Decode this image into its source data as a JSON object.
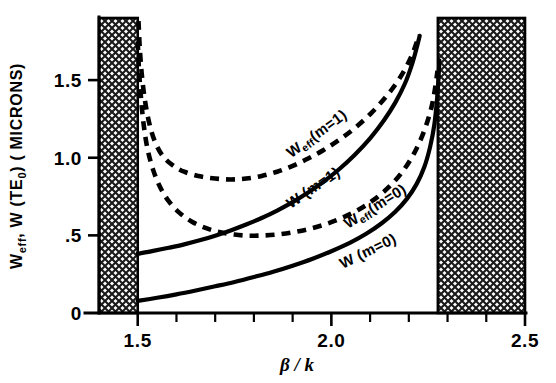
{
  "chart_data": {
    "type": "line",
    "title": "",
    "xlabel": "β / k",
    "ylabel": "Weff, W (TE0) (MICRONS)",
    "ylabel_parts": {
      "w": "W",
      "eff": "eff",
      "comma_w": ", W (TE",
      "zero": "0",
      "units": ") ( MICRONS)"
    },
    "xlim": [
      1.4,
      2.5
    ],
    "ylim": [
      0.0,
      1.9
    ],
    "xticks": [
      1.5,
      2.0,
      2.5
    ],
    "xtick_labels": [
      "1.5",
      "2.0",
      "2.5"
    ],
    "xticks_minor": [
      1.6,
      1.7,
      1.8,
      1.9,
      2.1,
      2.2,
      2.3,
      2.4
    ],
    "yticks": [
      0,
      0.5,
      1.0,
      1.5
    ],
    "ytick_labels": [
      "0",
      ".5",
      "1.0",
      "1.5"
    ],
    "grid": false,
    "legend_position": "inline-annotations",
    "shaded_regions": [
      {
        "name": "left-forbidden-band",
        "x0": 1.4,
        "x1": 1.5,
        "style": "cross-hatch"
      },
      {
        "name": "right-forbidden-band",
        "x0": 2.275,
        "x1": 2.5,
        "style": "cross-hatch"
      }
    ],
    "series": [
      {
        "name": "Weff(m=1)",
        "label": "Weff (m=1)",
        "label_base": "W",
        "label_sub": "eff",
        "label_rest": "(m=1)",
        "style": "dashed",
        "points": [
          [
            1.502,
            1.88
          ],
          [
            1.505,
            1.72
          ],
          [
            1.51,
            1.55
          ],
          [
            1.518,
            1.38
          ],
          [
            1.53,
            1.22
          ],
          [
            1.545,
            1.1
          ],
          [
            1.565,
            1.01
          ],
          [
            1.59,
            0.952
          ],
          [
            1.62,
            0.91
          ],
          [
            1.66,
            0.88
          ],
          [
            1.7,
            0.866
          ],
          [
            1.74,
            0.86
          ],
          [
            1.78,
            0.866
          ],
          [
            1.82,
            0.883
          ],
          [
            1.86,
            0.91
          ],
          [
            1.9,
            0.948
          ],
          [
            1.94,
            0.995
          ],
          [
            1.98,
            1.05
          ],
          [
            2.02,
            1.115
          ],
          [
            2.06,
            1.19
          ],
          [
            2.1,
            1.28
          ],
          [
            2.135,
            1.375
          ],
          [
            2.165,
            1.47
          ],
          [
            2.19,
            1.57
          ],
          [
            2.208,
            1.66
          ],
          [
            2.22,
            1.74
          ],
          [
            2.227,
            1.79
          ]
        ]
      },
      {
        "name": "W(m=1)",
        "label": "W (m=1)",
        "label_base": "W",
        "label_sub": "",
        "label_rest": "(m=1)",
        "style": "solid",
        "points": [
          [
            1.5,
            0.382
          ],
          [
            1.54,
            0.4
          ],
          [
            1.58,
            0.42
          ],
          [
            1.62,
            0.442
          ],
          [
            1.66,
            0.468
          ],
          [
            1.7,
            0.498
          ],
          [
            1.74,
            0.532
          ],
          [
            1.78,
            0.57
          ],
          [
            1.82,
            0.612
          ],
          [
            1.86,
            0.66
          ],
          [
            1.9,
            0.714
          ],
          [
            1.94,
            0.776
          ],
          [
            1.98,
            0.846
          ],
          [
            2.02,
            0.926
          ],
          [
            2.06,
            1.018
          ],
          [
            2.1,
            1.125
          ],
          [
            2.135,
            1.238
          ],
          [
            2.165,
            1.355
          ],
          [
            2.19,
            1.478
          ],
          [
            2.208,
            1.6
          ],
          [
            2.22,
            1.705
          ],
          [
            2.228,
            1.785
          ]
        ]
      },
      {
        "name": "Weff(m=0)",
        "label": "Weff (m=0)",
        "label_base": "W",
        "label_sub": "eff",
        "label_rest": "(m=0)",
        "style": "dashed",
        "points": [
          [
            1.5,
            1.75
          ],
          [
            1.503,
            1.58
          ],
          [
            1.508,
            1.4
          ],
          [
            1.515,
            1.22
          ],
          [
            1.525,
            1.06
          ],
          [
            1.54,
            0.92
          ],
          [
            1.558,
            0.81
          ],
          [
            1.58,
            0.72
          ],
          [
            1.608,
            0.645
          ],
          [
            1.64,
            0.588
          ],
          [
            1.675,
            0.548
          ],
          [
            1.71,
            0.522
          ],
          [
            1.75,
            0.505
          ],
          [
            1.79,
            0.498
          ],
          [
            1.83,
            0.5
          ],
          [
            1.87,
            0.508
          ],
          [
            1.91,
            0.524
          ],
          [
            1.95,
            0.546
          ],
          [
            1.99,
            0.576
          ],
          [
            2.03,
            0.615
          ],
          [
            2.07,
            0.665
          ],
          [
            2.11,
            0.73
          ],
          [
            2.15,
            0.815
          ],
          [
            2.185,
            0.915
          ],
          [
            2.215,
            1.035
          ],
          [
            2.24,
            1.175
          ],
          [
            2.258,
            1.32
          ],
          [
            2.268,
            1.45
          ],
          [
            2.274,
            1.56
          ]
        ]
      },
      {
        "name": "W(m=0)",
        "label": "W (m=0)",
        "label_base": "W",
        "label_sub": "",
        "label_rest": "(m=0)",
        "style": "solid",
        "points": [
          [
            1.5,
            0.078
          ],
          [
            1.55,
            0.098
          ],
          [
            1.6,
            0.12
          ],
          [
            1.65,
            0.145
          ],
          [
            1.7,
            0.172
          ],
          [
            1.75,
            0.2
          ],
          [
            1.8,
            0.232
          ],
          [
            1.85,
            0.266
          ],
          [
            1.9,
            0.305
          ],
          [
            1.95,
            0.348
          ],
          [
            2.0,
            0.398
          ],
          [
            2.05,
            0.455
          ],
          [
            2.09,
            0.51
          ],
          [
            2.13,
            0.578
          ],
          [
            2.165,
            0.652
          ],
          [
            2.195,
            0.735
          ],
          [
            2.22,
            0.83
          ],
          [
            2.24,
            0.94
          ],
          [
            2.255,
            1.07
          ],
          [
            2.266,
            1.215
          ],
          [
            2.273,
            1.38
          ],
          [
            2.277,
            1.53
          ],
          [
            2.279,
            1.625
          ]
        ]
      }
    ],
    "annotations": [
      {
        "name": "weff-m1-label",
        "text": "Weff(m=1)",
        "x": 1.97,
        "y": 1.13,
        "rotation": -36
      },
      {
        "name": "w-m1-label",
        "text": "W(m=1)",
        "x": 1.96,
        "y": 0.78,
        "rotation": -34
      },
      {
        "name": "weff-m0-label",
        "text": "Weff(m=0)",
        "x": 2.12,
        "y": 0.66,
        "rotation": -32
      },
      {
        "name": "w-m0-label",
        "text": "W(m=0)",
        "x": 2.1,
        "y": 0.37,
        "rotation": -26
      }
    ]
  },
  "figure": {
    "background": "#ffffff",
    "ink_color": "#000000",
    "hatch_color": "#2a2a2a"
  }
}
